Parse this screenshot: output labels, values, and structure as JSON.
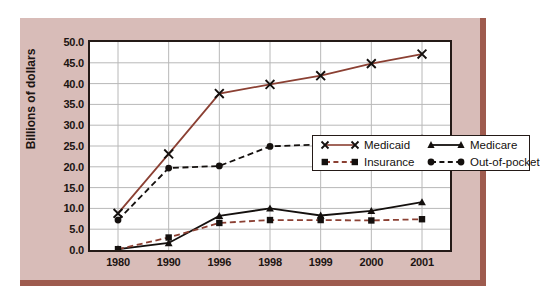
{
  "chart_data": {
    "type": "line",
    "title": "",
    "xlabel": "",
    "ylabel": "Billions of dollars",
    "categories": [
      "1980",
      "1990",
      "1996",
      "1998",
      "1999",
      "2000",
      "2001"
    ],
    "ylim": [
      0.0,
      50.0
    ],
    "ytick_step": 5.0,
    "yticks": [
      "0.0",
      "5.0",
      "10.0",
      "15.0",
      "20.0",
      "25.0",
      "30.0",
      "35.0",
      "40.0",
      "45.0",
      "50.0"
    ],
    "grid": true,
    "legend_position": "inside-upper-center",
    "series": [
      {
        "name": "Medicaid",
        "values": [
          8.8,
          23.1,
          37.6,
          39.8,
          41.9,
          44.8,
          47.1
        ],
        "color": "#8b4033",
        "marker": "x",
        "linestyle": "solid"
      },
      {
        "name": "Medicare",
        "values": [
          0.2,
          1.7,
          8.2,
          10.0,
          8.3,
          9.4,
          11.5
        ],
        "color": "#14100e",
        "marker": "triangle",
        "linestyle": "solid"
      },
      {
        "name": "Insurance",
        "values": [
          0.2,
          3.0,
          6.5,
          7.2,
          7.2,
          7.1,
          7.4
        ],
        "color": "#8b4033",
        "marker": "square",
        "linestyle": "dashed"
      },
      {
        "name": "Out-of-pocket",
        "values": [
          7.2,
          19.7,
          20.2,
          24.9,
          25.4,
          26.1,
          26.9
        ],
        "color": "#14100e",
        "marker": "circle",
        "linestyle": "dashed"
      }
    ]
  },
  "legend": {
    "entries": [
      {
        "label": "Medicaid",
        "series": 0
      },
      {
        "label": "Medicare",
        "series": 1
      },
      {
        "label": "Insurance",
        "series": 2
      },
      {
        "label": "Out-of-pocket",
        "series": 3
      }
    ]
  },
  "colors": {
    "panel_background": "#d8bcb8",
    "panel_edge": "#9e5b4e",
    "plot_background": "#ffffff",
    "axis": "#241a17",
    "gridline": "#b8b8b8",
    "page_background": "#ffffff"
  }
}
